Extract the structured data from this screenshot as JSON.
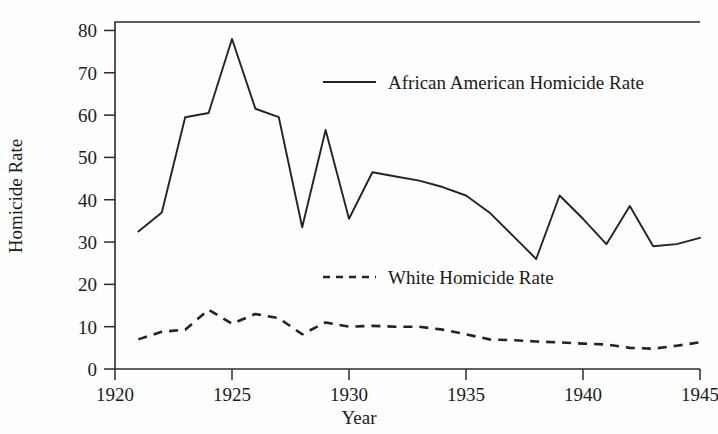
{
  "chart_data": {
    "type": "line",
    "title": "",
    "xlabel": "Year",
    "ylabel": "Homicide Rate",
    "xlim": [
      1920,
      1945
    ],
    "ylim": [
      0,
      82
    ],
    "grid": false,
    "legend_position": "inside-upper-right",
    "x_ticks": [
      "1920",
      "1925",
      "1930",
      "1935",
      "1940",
      "1945"
    ],
    "x_tick_values": [
      1920,
      1925,
      1930,
      1935,
      1940,
      1945
    ],
    "y_ticks": [
      "0",
      "10",
      "20",
      "30",
      "40",
      "50",
      "60",
      "70",
      "80"
    ],
    "y_tick_values": [
      0,
      10,
      20,
      30,
      40,
      50,
      60,
      70,
      80
    ],
    "x": [
      1921,
      1922,
      1923,
      1924,
      1925,
      1926,
      1927,
      1928,
      1929,
      1930,
      1931,
      1932,
      1933,
      1934,
      1935,
      1936,
      1937,
      1938,
      1939,
      1940,
      1941,
      1942,
      1943,
      1944,
      1945
    ],
    "series": [
      {
        "name": "African American Homicide Rate",
        "style": "solid",
        "values": [
          32.5,
          37.0,
          59.5,
          60.5,
          78.0,
          61.5,
          59.5,
          33.5,
          56.5,
          35.5,
          46.5,
          45.5,
          44.5,
          43.0,
          41.0,
          37.0,
          31.5,
          26.0,
          41.0,
          35.5,
          29.5,
          38.5,
          29.0,
          29.5,
          31.0
        ]
      },
      {
        "name": "White Homicide Rate",
        "style": "dashed",
        "values": [
          7.0,
          8.8,
          9.3,
          14.0,
          10.7,
          13.0,
          12.0,
          8.2,
          11.0,
          10.0,
          10.2,
          10.0,
          10.0,
          9.3,
          8.2,
          7.0,
          6.8,
          6.5,
          6.3,
          6.0,
          5.8,
          5.0,
          4.8,
          5.5,
          6.3
        ]
      }
    ]
  },
  "legend": {
    "entries": [
      {
        "label": "African American Homicide Rate",
        "style": "solid"
      },
      {
        "label": "White Homicide Rate",
        "style": "dashed"
      }
    ]
  },
  "axes": {
    "x_title": "Year",
    "y_title": "Homicide Rate"
  }
}
